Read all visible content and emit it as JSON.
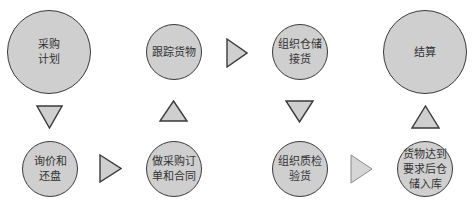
{
  "diagram": {
    "title": "",
    "style": {
      "node_fill": "#cfcfcf",
      "node_stroke": "#3a3a3a",
      "arrow_fill": "#cfcfcf",
      "arrow_stroke": "#3a3a3a",
      "arrow_fill_light": "#d6d6d6",
      "arrow_stroke_light": "#8a8a8a",
      "text_color": "#333333"
    },
    "nodes": [
      {
        "id": "n1",
        "label": "采购\n计划",
        "cx": 49,
        "cy": 52,
        "r": 42
      },
      {
        "id": "n2",
        "label": "询价和\n还盘",
        "cx": 50,
        "cy": 169,
        "r": 28
      },
      {
        "id": "n3",
        "label": "做采购订\n单和合同",
        "cx": 174,
        "cy": 169,
        "r": 28
      },
      {
        "id": "n4",
        "label": "跟踪货物",
        "cx": 174,
        "cy": 52,
        "r": 28
      },
      {
        "id": "n5",
        "label": "组织仓储\n接货",
        "cx": 300,
        "cy": 52,
        "r": 28
      },
      {
        "id": "n6",
        "label": "组织质检\n验货",
        "cx": 300,
        "cy": 169,
        "r": 28
      },
      {
        "id": "n7",
        "label": "货物达到\n要求后仓\n储入库",
        "cx": 425,
        "cy": 169,
        "r": 28
      },
      {
        "id": "n8",
        "label": "结算",
        "cx": 425,
        "cy": 52,
        "r": 42
      }
    ],
    "arrows": [
      {
        "id": "a1",
        "from": "n1",
        "to": "n2",
        "direction": "down",
        "x": 36,
        "y": 105,
        "w": 27,
        "h": 24,
        "light": false
      },
      {
        "id": "a2",
        "from": "n2",
        "to": "n3",
        "direction": "right",
        "x": 99,
        "y": 154,
        "w": 23,
        "h": 29,
        "light": false
      },
      {
        "id": "a3",
        "from": "n3",
        "to": "n4",
        "direction": "up",
        "x": 159,
        "y": 100,
        "w": 29,
        "h": 22,
        "light": false
      },
      {
        "id": "a4",
        "from": "n4",
        "to": "n5",
        "direction": "right",
        "x": 226,
        "y": 38,
        "w": 22,
        "h": 30,
        "light": false
      },
      {
        "id": "a5",
        "from": "n5",
        "to": "n6",
        "direction": "down",
        "x": 285,
        "y": 100,
        "w": 29,
        "h": 23,
        "light": false
      },
      {
        "id": "a6",
        "from": "n6",
        "to": "n7",
        "direction": "right",
        "x": 350,
        "y": 154,
        "w": 23,
        "h": 30,
        "light": true
      },
      {
        "id": "a7",
        "from": "n7",
        "to": "n8",
        "direction": "up",
        "x": 411,
        "y": 105,
        "w": 29,
        "h": 24,
        "light": false
      }
    ]
  }
}
